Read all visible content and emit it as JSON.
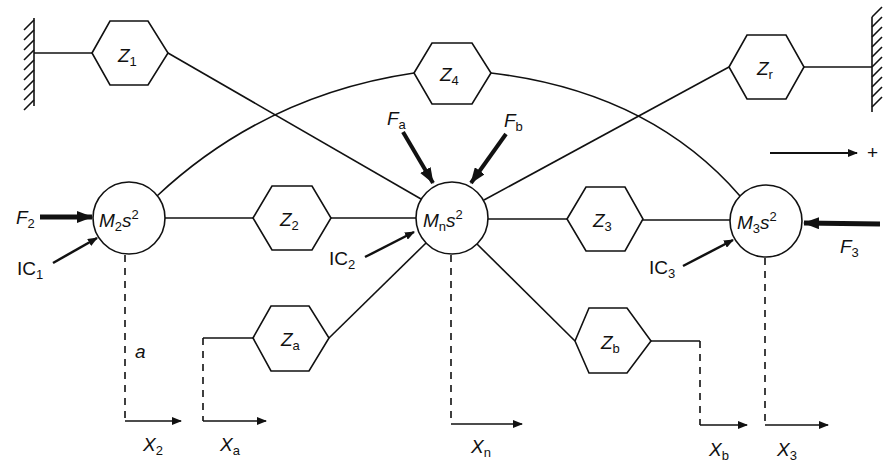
{
  "diagram": {
    "type": "mechanical-impedance-network",
    "positive_direction_label": "+",
    "walls": [
      {
        "id": "left-wall",
        "side": "left"
      },
      {
        "id": "right-wall",
        "side": "right"
      }
    ],
    "masses": [
      {
        "id": "M2",
        "main": "M",
        "sub": "2",
        "suffix": "s",
        "power": "2"
      },
      {
        "id": "Mn",
        "main": "M",
        "sub": "n",
        "suffix": "s",
        "power": "2"
      },
      {
        "id": "M3",
        "main": "M",
        "sub": "3",
        "suffix": "s",
        "power": "2"
      }
    ],
    "impedances": [
      {
        "id": "Z1",
        "main": "Z",
        "sub": "1",
        "connects": [
          "left-wall",
          "Mn"
        ]
      },
      {
        "id": "Z4",
        "main": "Z",
        "sub": "4",
        "connects": [
          "M2",
          "M3"
        ]
      },
      {
        "id": "Zr",
        "main": "Z",
        "sub": "r",
        "connects": [
          "Mn",
          "right-wall"
        ]
      },
      {
        "id": "Z2",
        "main": "Z",
        "sub": "2",
        "connects": [
          "M2",
          "Mn"
        ]
      },
      {
        "id": "Z3",
        "main": "Z",
        "sub": "3",
        "connects": [
          "Mn",
          "M3"
        ]
      },
      {
        "id": "Za",
        "main": "Z",
        "sub": "a",
        "connects": [
          "Mn",
          "Xa"
        ]
      },
      {
        "id": "Zb",
        "main": "Z",
        "sub": "b",
        "connects": [
          "Mn",
          "Xb"
        ]
      }
    ],
    "forces": [
      {
        "id": "F2",
        "main": "F",
        "sub": "2",
        "target": "M2"
      },
      {
        "id": "Fa",
        "main": "F",
        "sub": "a",
        "target": "Mn"
      },
      {
        "id": "Fb",
        "main": "F",
        "sub": "b",
        "target": "Mn"
      },
      {
        "id": "F3",
        "main": "F",
        "sub": "3",
        "target": "M3"
      }
    ],
    "initial_conditions": [
      {
        "id": "IC1",
        "main": "IC",
        "sub": "1",
        "target": "M2"
      },
      {
        "id": "IC2",
        "main": "IC",
        "sub": "2",
        "target": "Mn"
      },
      {
        "id": "IC3",
        "main": "IC",
        "sub": "3",
        "target": "M3"
      }
    ],
    "displacements": [
      {
        "id": "X2",
        "main": "X",
        "sub": "2"
      },
      {
        "id": "Xa",
        "main": "X",
        "sub": "a"
      },
      {
        "id": "Xn",
        "main": "X",
        "sub": "n"
      },
      {
        "id": "Xb",
        "main": "X",
        "sub": "b"
      },
      {
        "id": "X3",
        "main": "X",
        "sub": "3"
      }
    ],
    "annotation_a": "a"
  }
}
